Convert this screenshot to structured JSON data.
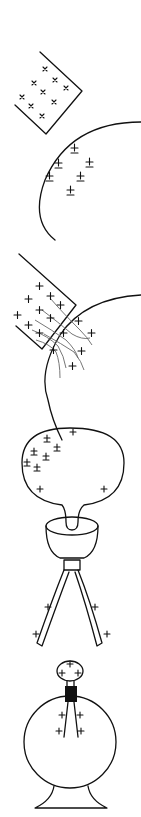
{
  "figure": {
    "panels": [
      {
        "id": "separated-charged-objects",
        "description": "Positively charged block and sphere bearing induced separated charges"
      },
      {
        "id": "contact-charge-transfer",
        "description": "Charged block touching sphere, charges flowing across contact"
      },
      {
        "id": "bulb-on-stand",
        "description": "Charged bulb on a stand with two diverging leaves"
      },
      {
        "id": "electroscope",
        "description": "Electroscope: knob, stopper and diverging leaves inside a flask"
      }
    ],
    "symbols": {
      "positive": "+",
      "cross": "×",
      "plus_minus": "±"
    },
    "colors": {
      "ink": "#111111",
      "flow_lines": "#666666",
      "background": "#ffffff"
    }
  }
}
